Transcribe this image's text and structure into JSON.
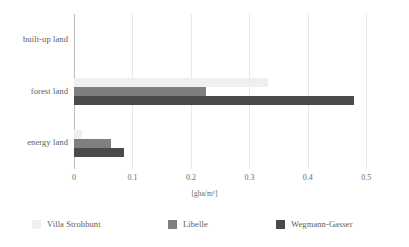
{
  "chart_data": {
    "type": "bar",
    "orientation": "horizontal",
    "title": "",
    "subtitle": "",
    "xlabel": "[gha/m²]",
    "ylabel": "",
    "categories": [
      "built-up land",
      "forest land",
      "energy land"
    ],
    "series": [
      {
        "name": "Villa Strohbunt",
        "color": "#efefef",
        "values": [
          0.0,
          0.331,
          0.013
        ]
      },
      {
        "name": "Libelle",
        "color": "#7f7f7f",
        "values": [
          0.0,
          0.225,
          0.064
        ]
      },
      {
        "name": "Wegmann-Gasser",
        "color": "#4a4a4a",
        "values": [
          0.0,
          0.479,
          0.086
        ]
      }
    ],
    "xlim": [
      0,
      0.52
    ],
    "xticks": [
      0,
      0.1,
      0.2,
      0.3,
      0.4,
      0.5
    ],
    "xtick_labels": [
      "0",
      "0.1",
      "0.2",
      "0.3",
      "0.4",
      "0.5"
    ],
    "grid": true,
    "grid_axis": "x",
    "legend_position": "bottom",
    "background_color": "#ffffff",
    "axis_color": "#bdbdbd",
    "gridline_color": "#e9e9e9"
  }
}
